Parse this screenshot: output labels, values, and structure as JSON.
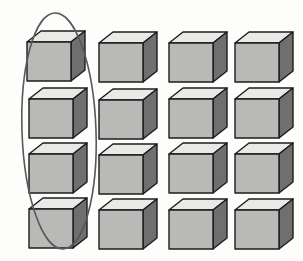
{
  "figure": {
    "background_color": "#fdfdfc",
    "width": 303,
    "height": 261
  },
  "array": {
    "rows": 4,
    "columns": 4,
    "total_cubes": 16,
    "row_labels": [
      "row-1",
      "row-2",
      "row-3",
      "row-4"
    ],
    "column_labels": [
      "column-1",
      "column-2",
      "column-3",
      "column-4"
    ],
    "cubes": [
      {
        "row": 1,
        "column": 1,
        "x": 27,
        "y": 31,
        "grouped": true
      },
      {
        "row": 1,
        "column": 2,
        "x": 99,
        "y": 32,
        "grouped": false
      },
      {
        "row": 1,
        "column": 3,
        "x": 169,
        "y": 32,
        "grouped": false
      },
      {
        "row": 1,
        "column": 4,
        "x": 235,
        "y": 32,
        "grouped": false
      },
      {
        "row": 2,
        "column": 1,
        "x": 29,
        "y": 88,
        "grouped": true
      },
      {
        "row": 2,
        "column": 2,
        "x": 99,
        "y": 89,
        "grouped": false
      },
      {
        "row": 2,
        "column": 3,
        "x": 169,
        "y": 88,
        "grouped": false
      },
      {
        "row": 2,
        "column": 4,
        "x": 235,
        "y": 88,
        "grouped": false
      },
      {
        "row": 3,
        "column": 1,
        "x": 29,
        "y": 143,
        "grouped": true
      },
      {
        "row": 3,
        "column": 2,
        "x": 99,
        "y": 144,
        "grouped": false
      },
      {
        "row": 3,
        "column": 3,
        "x": 169,
        "y": 143,
        "grouped": false
      },
      {
        "row": 3,
        "column": 4,
        "x": 235,
        "y": 143,
        "grouped": false
      },
      {
        "row": 4,
        "column": 1,
        "x": 29,
        "y": 198,
        "grouped": true
      },
      {
        "row": 4,
        "column": 2,
        "x": 99,
        "y": 199,
        "grouped": false
      },
      {
        "row": 4,
        "column": 3,
        "x": 169,
        "y": 199,
        "grouped": false
      },
      {
        "row": 4,
        "column": 4,
        "x": 235,
        "y": 199,
        "grouped": false
      }
    ]
  },
  "cube_style": {
    "top_face_color": "#e9e9e7",
    "front_face_color": "#b9b9b7",
    "right_face_color": "#6f6f6f",
    "outline_color": "#1c1c1c",
    "outline_width": 1.4,
    "width": 58,
    "height": 50
  },
  "highlight": {
    "shape": "ellipse",
    "target": "column-1",
    "center_x": 59,
    "center_y": 131,
    "radius_x": 37,
    "radius_y": 118,
    "rotation_deg": -2,
    "stroke_color": "#585858",
    "stroke_width": 1.6,
    "fill": "none"
  }
}
